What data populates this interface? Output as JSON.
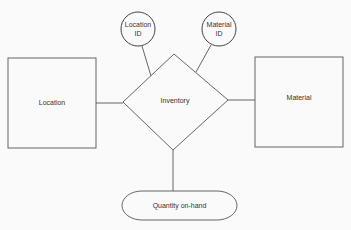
{
  "diagram": {
    "type": "entity-relationship",
    "entities": [
      {
        "id": "location",
        "label": "Location"
      },
      {
        "id": "material",
        "label": "Material"
      }
    ],
    "relationship": {
      "id": "inventory",
      "label": "Inventory"
    },
    "attributes": [
      {
        "id": "location_id",
        "label_line1": "Location",
        "label_line2": "ID",
        "attached_to": "inventory"
      },
      {
        "id": "material_id",
        "label_line1": "Material",
        "label_line2": "ID",
        "attached_to": "inventory"
      },
      {
        "id": "quantity_on_hand",
        "label": "Quantity on-hand",
        "attached_to": "inventory"
      }
    ],
    "edges": [
      {
        "from": "location",
        "to": "inventory"
      },
      {
        "from": "inventory",
        "to": "material"
      },
      {
        "from": "location_id",
        "to": "inventory"
      },
      {
        "from": "material_id",
        "to": "inventory"
      },
      {
        "from": "inventory",
        "to": "quantity_on_hand"
      }
    ],
    "colors": {
      "stroke": "#555555",
      "background": "#fafafa",
      "text": "#333333"
    }
  }
}
